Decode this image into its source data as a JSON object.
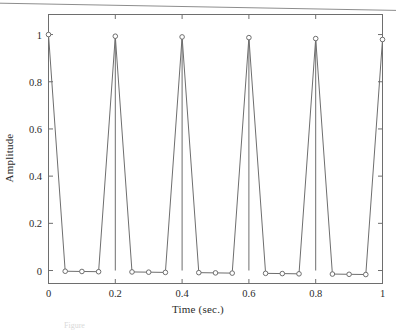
{
  "figure": {
    "background_color": "#ffffff",
    "ink_color": "#6e6e6e",
    "text_color": "#2b2b2b",
    "caption_fragment": "Figure"
  },
  "chart_data": {
    "type": "line",
    "render_style": "stem",
    "title": "",
    "subtitle": "",
    "xlabel": "Time (sec.)",
    "ylabel": "Amplitude",
    "xlim": [
      0,
      1
    ],
    "ylim": [
      -0.055,
      1.085
    ],
    "xticks": [
      0,
      0.2,
      0.4,
      0.6,
      0.8,
      1
    ],
    "xtick_labels": [
      "0",
      "0.2",
      "0.4",
      "0.6",
      "0.8",
      "1"
    ],
    "yticks": [
      0,
      0.2,
      0.4,
      0.6,
      0.8,
      1
    ],
    "ytick_labels": [
      "0",
      "0.2",
      "0.4",
      "0.6",
      "0.8",
      "1"
    ],
    "grid": false,
    "legend": null,
    "legend_position": "none",
    "marker": "open-circle",
    "sample_interval": 0.05,
    "x": [
      0,
      0.05,
      0.1,
      0.15,
      0.2,
      0.25,
      0.3,
      0.35,
      0.4,
      0.45,
      0.5,
      0.55,
      0.6,
      0.65,
      0.7,
      0.75,
      0.8,
      0.85,
      0.9,
      0.95,
      1
    ],
    "values": [
      1.0,
      -0.003,
      -0.004,
      -0.005,
      0.993,
      -0.006,
      -0.007,
      -0.008,
      0.99,
      -0.009,
      -0.01,
      -0.011,
      0.987,
      -0.012,
      -0.013,
      -0.014,
      0.983,
      -0.015,
      -0.016,
      -0.017,
      0.979
    ],
    "series": [
      {
        "name": "impulse train",
        "values": [
          1.0,
          -0.003,
          -0.004,
          -0.005,
          0.993,
          -0.006,
          -0.007,
          -0.008,
          0.99,
          -0.009,
          -0.01,
          -0.011,
          0.987,
          -0.012,
          -0.013,
          -0.014,
          0.983,
          -0.015,
          -0.016,
          -0.017,
          0.979
        ]
      }
    ]
  }
}
